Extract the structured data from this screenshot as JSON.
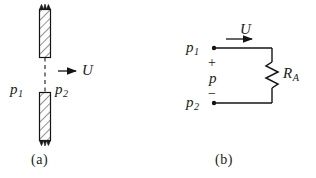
{
  "figure": {
    "caption_a": "(a)",
    "caption_b": "(b)",
    "panel_a": {
      "name": "fluid-gap-schematic",
      "pressure_upstream": "p",
      "pressure_upstream_sub": "1",
      "pressure_downstream": "p",
      "pressure_downstream_sub": "2",
      "flow_symbol": "U",
      "flow_arrow": "right-arrow-icon",
      "walls": [
        {
          "name": "upper-wall",
          "hatched": true,
          "break_edge": "top"
        },
        {
          "name": "lower-wall",
          "hatched": true,
          "break_edge": "bottom"
        }
      ],
      "centerline_style": "dashed"
    },
    "panel_b": {
      "name": "equivalent-circuit",
      "node_top": "p",
      "node_top_sub": "1",
      "node_bottom": "p",
      "node_bottom_sub": "2",
      "current_symbol": "U",
      "current_arrow": "right-arrow-icon",
      "potential_symbol": "p",
      "polarity_plus": "+",
      "polarity_minus": "−",
      "resistor_symbol": "R",
      "resistor_sub": "A",
      "resistor_style": "zigzag"
    }
  },
  "colors": {
    "ink": "#1a1a1a",
    "line": "#141414",
    "hatch": "#3a3a3a",
    "paper": "#ffffff"
  }
}
